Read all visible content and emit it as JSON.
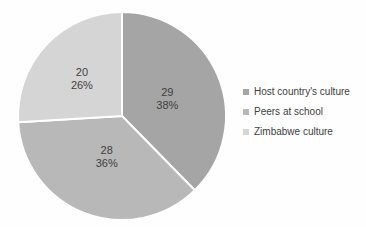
{
  "chart_data": {
    "type": "pie",
    "title": "",
    "categories": [
      "Host country's culture",
      "Peers at school",
      "Zimbabwe culture"
    ],
    "values": [
      29,
      28,
      20
    ],
    "percent_labels": [
      "38%",
      "36%",
      "26%"
    ],
    "colors": [
      "#a5a5a5",
      "#b8b8b8",
      "#d5d5d5"
    ],
    "slices": [
      {
        "label": "Host country's culture",
        "value": 29,
        "pct": "38%",
        "color": "#a5a5a5"
      },
      {
        "label": "Peers at school",
        "value": 28,
        "pct": "36%",
        "color": "#b8b8b8"
      },
      {
        "label": "Zimbabwe culture",
        "value": 20,
        "pct": "26%",
        "color": "#d5d5d5"
      }
    ],
    "start_angle_deg": 0,
    "direction": "clockwise",
    "legend_position": "right",
    "data_label_format": "value and percent on two lines",
    "slice_border_color": "#ffffff",
    "label_text_color": "#3f3f3f"
  }
}
